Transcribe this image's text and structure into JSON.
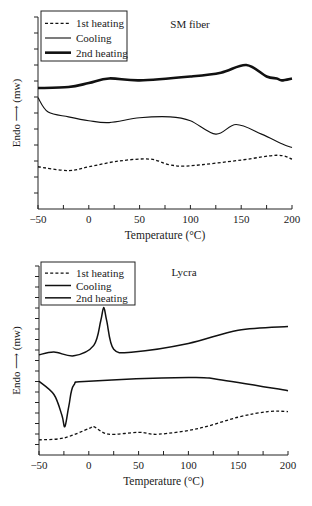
{
  "chart_data": [
    {
      "type": "line",
      "title": "SM fiber",
      "xlabel": "Temperature (°C)",
      "ylabel": "Endo ⟶ (mw)",
      "xlim": [
        -50,
        200
      ],
      "ylim": [
        0,
        10
      ],
      "xticks": [
        -50,
        0,
        50,
        100,
        150,
        200
      ],
      "xtick_labels": [
        "−50",
        "0",
        "50",
        "100",
        "150",
        "200"
      ],
      "y_tick_labels_shown": false,
      "legend": {
        "position": "top-left",
        "entries": [
          "1st heating",
          "Cooling",
          "2nd heating"
        ]
      },
      "series": [
        {
          "name": "1st heating",
          "style": "dashed",
          "x": [
            -50,
            -20,
            0,
            30,
            60,
            80,
            100,
            150,
            185,
            200
          ],
          "y": [
            2.2,
            2.0,
            2.2,
            2.5,
            2.6,
            2.3,
            2.25,
            2.55,
            2.8,
            2.6
          ]
        },
        {
          "name": "Cooling",
          "style": "solid-thin",
          "x": [
            -50,
            -40,
            -20,
            0,
            20,
            50,
            80,
            100,
            125,
            145,
            170,
            190,
            200
          ],
          "y": [
            5.8,
            5.05,
            4.8,
            4.6,
            4.5,
            4.75,
            4.8,
            4.6,
            3.9,
            4.4,
            3.9,
            3.4,
            3.2
          ]
        },
        {
          "name": "2nd heating",
          "style": "solid-thick",
          "x": [
            -50,
            -20,
            0,
            20,
            50,
            100,
            130,
            155,
            175,
            185,
            190,
            200
          ],
          "y": [
            6.3,
            6.35,
            6.56,
            6.8,
            6.7,
            6.9,
            7.1,
            7.5,
            6.9,
            6.8,
            6.7,
            6.8
          ]
        }
      ]
    },
    {
      "type": "line",
      "title": "Lycra",
      "xlabel": "Temperature (°C)",
      "ylabel": "Endo ⟶ (mw)",
      "xlim": [
        -50,
        200
      ],
      "ylim": [
        0,
        10
      ],
      "xticks": [
        -50,
        0,
        50,
        100,
        150,
        200
      ],
      "xtick_labels": [
        "−50",
        "0",
        "50",
        "100",
        "150",
        "200"
      ],
      "y_tick_labels_shown": false,
      "legend": {
        "position": "top-left",
        "entries": [
          "1st heating",
          "Cooling",
          "2nd heating"
        ]
      },
      "series": [
        {
          "name": "1st heating",
          "style": "dashed",
          "x": [
            -50,
            -25,
            0,
            5,
            20,
            50,
            70,
            110,
            150,
            180,
            200
          ],
          "y": [
            0.8,
            0.9,
            1.4,
            1.5,
            1.1,
            1.2,
            1.1,
            1.4,
            2.0,
            2.3,
            2.3
          ]
        },
        {
          "name": "Cooling",
          "style": "solid",
          "x": [
            -50,
            -35,
            -27,
            -24,
            -20,
            -15,
            0,
            100,
            130,
            200
          ],
          "y": [
            3.9,
            3.2,
            2.1,
            1.5,
            2.6,
            3.7,
            3.9,
            4.1,
            4.0,
            3.4
          ]
        },
        {
          "name": "2nd heating",
          "style": "solid",
          "x": [
            -50,
            -35,
            -15,
            5,
            12,
            15,
            18,
            25,
            45,
            100,
            150,
            200
          ],
          "y": [
            5.3,
            5.45,
            5.25,
            5.8,
            7.1,
            7.8,
            7.1,
            5.6,
            5.45,
            5.9,
            6.6,
            6.8
          ]
        }
      ]
    }
  ]
}
